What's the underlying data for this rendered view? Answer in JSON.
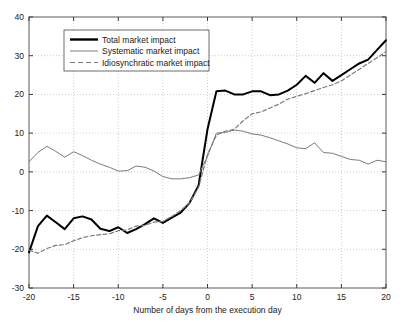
{
  "chart_data": {
    "type": "line",
    "title": "",
    "xlabel": "Number of days from the execution day",
    "ylabel": "",
    "xlim": [
      -20,
      20
    ],
    "ylim": [
      -30,
      40
    ],
    "xticks": [
      -20,
      -15,
      -10,
      -5,
      0,
      5,
      10,
      15,
      20
    ],
    "yticks": [
      -30,
      -20,
      -10,
      0,
      10,
      20,
      30,
      40
    ],
    "xtick_labels": [
      "-20",
      "-15",
      "-10",
      "-5",
      "0",
      "5",
      "10",
      "15",
      "20"
    ],
    "ytick_labels": [
      "-30",
      "-20",
      "-10",
      "0",
      "10",
      "20",
      "30",
      "40"
    ],
    "grid": true,
    "grid_style": "dotted",
    "legend_position": "upper left",
    "x": [
      -20,
      -19,
      -18,
      -17,
      -16,
      -15,
      -14,
      -13,
      -12,
      -11,
      -10,
      -9,
      -8,
      -7,
      -6,
      -5,
      -4,
      -3,
      -2,
      -1,
      0,
      1,
      2,
      3,
      4,
      5,
      6,
      7,
      8,
      9,
      10,
      11,
      12,
      13,
      14,
      15,
      16,
      17,
      18,
      19,
      20
    ],
    "series": [
      {
        "name": "Total market impact",
        "color": "#000000",
        "style": "solid",
        "width": 2.0,
        "values": [
          -20.8,
          -14.0,
          -11.3,
          -13.0,
          -14.8,
          -12.0,
          -11.5,
          -12.3,
          -14.7,
          -15.3,
          -14.3,
          -15.8,
          -14.8,
          -13.5,
          -12.0,
          -13.2,
          -11.8,
          -10.5,
          -8.0,
          -3.5,
          11.0,
          20.8,
          21.0,
          20.0,
          20.0,
          20.8,
          20.8,
          19.8,
          20.0,
          21.0,
          22.5,
          24.8,
          23.0,
          25.5,
          23.5,
          25.0,
          26.5,
          28.0,
          29.0,
          31.5,
          34.0
        ]
      },
      {
        "name": "Systematic market impact",
        "color": "#7a7a7a",
        "style": "solid",
        "width": 1.0,
        "values": [
          2.6,
          5.0,
          6.6,
          5.3,
          3.8,
          5.2,
          4.2,
          3.0,
          2.0,
          1.2,
          0.2,
          0.3,
          1.5,
          1.2,
          0.2,
          -1.2,
          -1.8,
          -1.8,
          -1.5,
          -0.8,
          4.0,
          10.0,
          10.2,
          10.8,
          10.5,
          9.8,
          9.5,
          8.8,
          8.0,
          7.2,
          6.2,
          6.0,
          7.5,
          5.0,
          4.8,
          4.0,
          3.2,
          3.0,
          2.0,
          3.0,
          2.6
        ]
      },
      {
        "name": "Idiosynchratic market impact",
        "color": "#7a7a7a",
        "style": "dashed",
        "width": 1.2,
        "values": [
          -20.2,
          -21.0,
          -19.8,
          -19.0,
          -18.8,
          -17.8,
          -17.0,
          -16.5,
          -16.2,
          -16.0,
          -15.2,
          -15.0,
          -14.0,
          -13.8,
          -13.0,
          -12.8,
          -11.5,
          -10.0,
          -8.0,
          -4.0,
          4.5,
          9.5,
          10.5,
          11.0,
          13.2,
          15.0,
          15.5,
          16.5,
          17.5,
          18.8,
          19.5,
          20.2,
          21.0,
          21.8,
          22.5,
          23.5,
          25.0,
          26.5,
          28.0,
          29.5,
          31.0
        ]
      }
    ],
    "legend_entries": [
      {
        "label": "Total market impact",
        "style": "solid-thick",
        "color": "#000000"
      },
      {
        "label": "Systematic market impact",
        "style": "solid-thin",
        "color": "#7a7a7a"
      },
      {
        "label": "Idiosynchratic market impact",
        "style": "dashed",
        "color": "#7a7a7a"
      }
    ]
  }
}
